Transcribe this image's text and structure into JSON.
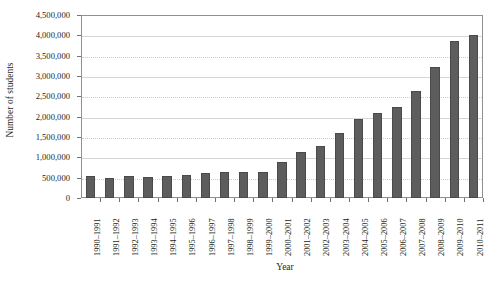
{
  "chart_data": {
    "type": "bar",
    "title": "",
    "xlabel": "Year",
    "ylabel": "Number of students",
    "ylim": [
      0,
      4500000
    ],
    "ytick_step": 500000,
    "grid": true,
    "grid_axis": "y",
    "legend": null,
    "bar_color": "#5d5d5d",
    "bar_edge_color": "#4a4a4a",
    "axis_color": "#8f9295",
    "gridline_color": "#d4d6d8",
    "ytick_labels": [
      "4,500,000",
      "4,000,000",
      "3,500,000",
      "3,000,000",
      "2,500,000",
      "2,000,000",
      "1,500,000",
      "1,000,000",
      "500,000",
      "0"
    ],
    "ytick_values": [
      4500000,
      4000000,
      3500000,
      3000000,
      2500000,
      2000000,
      1500000,
      1000000,
      500000,
      0
    ],
    "categories": [
      "1990–1991",
      "1991–1992",
      "1992–1993",
      "1993–1994",
      "1994–1995",
      "1995–1996",
      "1996–1997",
      "1997–1998",
      "1998–1999",
      "1999–2000",
      "2000–2001",
      "2001–2002",
      "2002–2003",
      "2003–2004",
      "2004–2005",
      "2005–2006",
      "2006–2007",
      "2007–2008",
      "2008–2009",
      "2009–2010",
      "2010–2011"
    ],
    "values": [
      530000,
      500000,
      540000,
      520000,
      540000,
      570000,
      620000,
      650000,
      650000,
      640000,
      880000,
      1130000,
      1280000,
      1600000,
      1950000,
      2100000,
      2250000,
      2620000,
      3220000,
      3850000,
      4010000
    ]
  }
}
